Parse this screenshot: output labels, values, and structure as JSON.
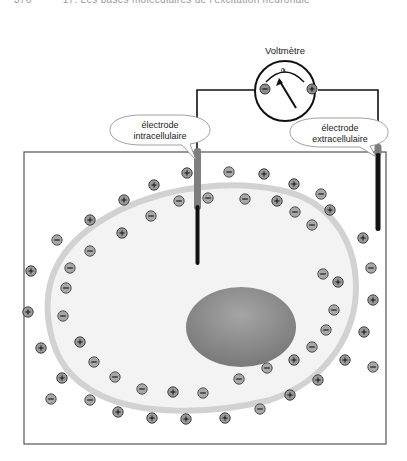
{
  "header": {
    "page_number": "376",
    "chapter_title": "17. Les bases moléculaires de l'excitation neuronale"
  },
  "voltmeter": {
    "title": "Voltmètre",
    "zero_label": "0",
    "negative_terminal": "−",
    "positive_terminal": "+"
  },
  "electrodes": {
    "intracellular": {
      "line1": "électrode",
      "line2": "intracellulaire"
    },
    "extracellular": {
      "line1": "électrode",
      "line2": "extracellulaire"
    }
  },
  "colors": {
    "cytoplasm": "#f2f2f2",
    "membrane": "#d4d4d4",
    "nucleus": "#8a8a8a",
    "ion_fill": "#9a9a9a",
    "wire": "#111111",
    "electrode_tip": "#808080"
  },
  "ions": {
    "legend_positive": "+",
    "legend_negative": "−"
  }
}
